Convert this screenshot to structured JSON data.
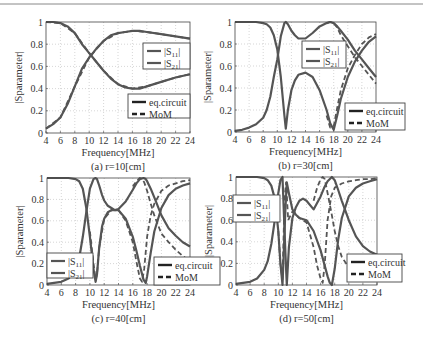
{
  "figure": {
    "top_rule": true,
    "colors": {
      "curve": "#555555",
      "axis": "#444444",
      "grid": "#bbbbbb",
      "text": "#333333"
    }
  },
  "chart_data": [
    {
      "type": "line",
      "caption": "(a) r=10[cm]",
      "xlabel": "Frequency[MHz]",
      "ylabel": "|Sparameter|",
      "xlim": [
        4,
        24
      ],
      "ylim": [
        0,
        1
      ],
      "xticks": [
        4,
        6,
        8,
        10,
        12,
        14,
        16,
        18,
        20,
        22,
        24
      ],
      "yticks": [
        0,
        0.2,
        0.4,
        0.6,
        0.8,
        1
      ],
      "grid": true,
      "legend_s": [
        "|S11|",
        "|S21|"
      ],
      "legend_method": [
        "eq.circuit",
        "MoM"
      ],
      "series": [
        {
          "name": "|S11| eq.circuit",
          "style": "solid",
          "x": [
            4,
            5,
            6,
            7,
            8,
            9,
            10,
            10.5,
            11,
            12,
            13,
            14,
            15,
            16,
            16.5,
            17,
            18,
            20,
            22,
            24
          ],
          "y": [
            1.0,
            1.0,
            0.99,
            0.96,
            0.9,
            0.8,
            0.72,
            0.68,
            0.64,
            0.56,
            0.49,
            0.44,
            0.41,
            0.4,
            0.4,
            0.4,
            0.42,
            0.46,
            0.5,
            0.53
          ]
        },
        {
          "name": "|S21| eq.circuit",
          "style": "solid",
          "x": [
            4,
            5,
            6,
            7,
            8,
            9,
            10,
            10.5,
            11,
            12,
            13,
            14,
            15,
            16,
            17,
            18,
            20,
            22,
            24
          ],
          "y": [
            0.04,
            0.08,
            0.14,
            0.26,
            0.42,
            0.58,
            0.68,
            0.72,
            0.76,
            0.83,
            0.88,
            0.9,
            0.91,
            0.92,
            0.92,
            0.91,
            0.89,
            0.87,
            0.85
          ]
        },
        {
          "name": "|S11| MoM",
          "style": "dashed",
          "x": [
            4,
            6,
            8,
            10,
            12,
            14,
            16,
            18,
            20,
            22,
            24
          ],
          "y": [
            1.0,
            0.99,
            0.9,
            0.72,
            0.56,
            0.44,
            0.4,
            0.42,
            0.46,
            0.5,
            0.53
          ]
        },
        {
          "name": "|S21| MoM",
          "style": "dashed",
          "x": [
            4,
            6,
            8,
            10,
            12,
            14,
            16,
            18,
            20,
            22,
            24
          ],
          "y": [
            0.04,
            0.14,
            0.42,
            0.68,
            0.83,
            0.9,
            0.92,
            0.91,
            0.89,
            0.87,
            0.85
          ]
        }
      ],
      "box": {
        "left": 46,
        "right": 190,
        "top": 22,
        "bottom": 133
      },
      "legend_s_box": {
        "x": 143,
        "y": 43,
        "w": 47,
        "h": 26
      },
      "legend_m_box": {
        "x": 128,
        "y": 94,
        "w": 62,
        "h": 24
      }
    },
    {
      "type": "line",
      "caption": "(b) r=30[cm]",
      "xlabel": "Frequency[MHz]",
      "ylabel": "|Sparameter|",
      "xlim": [
        4,
        24
      ],
      "ylim": [
        0,
        1
      ],
      "xticks": [
        4,
        6,
        8,
        10,
        12,
        14,
        16,
        18,
        20,
        22,
        24
      ],
      "yticks": [
        0,
        0.2,
        0.4,
        0.6,
        0.8,
        1
      ],
      "grid": true,
      "legend_s": [
        "|S11|",
        "|S21|"
      ],
      "legend_method": [
        "eq.circuit",
        "MoM"
      ],
      "series": [
        {
          "name": "|S11| eq.circuit",
          "style": "solid",
          "x": [
            4,
            6,
            7,
            8,
            8.5,
            9,
            9.5,
            10,
            10.5,
            11,
            11.2,
            11.5,
            12,
            12.5,
            13,
            14,
            15,
            16,
            17,
            17.5,
            18,
            18.5,
            19,
            20,
            21,
            22,
            23,
            24
          ],
          "y": [
            1.0,
            1.0,
            1.0,
            0.99,
            0.98,
            0.95,
            0.88,
            0.75,
            0.5,
            0.15,
            0.03,
            0.2,
            0.38,
            0.47,
            0.52,
            0.54,
            0.5,
            0.38,
            0.2,
            0.08,
            0.02,
            0.15,
            0.3,
            0.5,
            0.64,
            0.74,
            0.82,
            0.87
          ]
        },
        {
          "name": "|S21| eq.circuit",
          "style": "solid",
          "x": [
            4,
            5,
            6,
            7,
            8,
            8.5,
            9,
            9.5,
            10,
            10.5,
            11,
            11.2,
            11.5,
            12,
            12.5,
            13,
            14,
            15,
            16,
            17,
            17.5,
            18,
            18.5,
            19,
            20,
            21,
            22,
            23,
            24
          ],
          "y": [
            0.01,
            0.02,
            0.04,
            0.07,
            0.13,
            0.2,
            0.32,
            0.5,
            0.66,
            0.87,
            0.99,
            1.0,
            0.98,
            0.92,
            0.88,
            0.85,
            0.85,
            0.9,
            0.96,
            0.99,
            1.0,
            0.99,
            0.96,
            0.92,
            0.84,
            0.74,
            0.66,
            0.58,
            0.5
          ]
        },
        {
          "name": "|S11| MoM",
          "style": "dashed",
          "x": [
            17,
            17.5,
            18,
            18.5,
            19,
            20,
            21,
            22,
            23,
            24
          ],
          "y": [
            0.15,
            0.04,
            0.05,
            0.22,
            0.38,
            0.58,
            0.7,
            0.8,
            0.86,
            0.89
          ]
        },
        {
          "name": "|S21| MoM",
          "style": "dashed",
          "x": [
            17,
            17.5,
            18,
            18.5,
            19,
            20,
            21,
            22,
            23,
            24
          ],
          "y": [
            0.99,
            1.0,
            0.99,
            0.95,
            0.88,
            0.78,
            0.68,
            0.6,
            0.52,
            0.44
          ]
        }
      ],
      "box": {
        "left": 235,
        "right": 376,
        "top": 22,
        "bottom": 132
      },
      "legend_s_box": {
        "x": 302,
        "y": 41,
        "w": 44,
        "h": 27
      },
      "legend_m_box": {
        "x": 345,
        "y": 103,
        "w": 60,
        "h": 27
      }
    },
    {
      "type": "line",
      "caption": "(c) r=40[cm]",
      "xlabel": "Frequency[MHz]",
      "ylabel": "|Sparameter|",
      "xlim": [
        4,
        24
      ],
      "ylim": [
        0,
        1
      ],
      "xticks": [
        4,
        6,
        8,
        10,
        12,
        14,
        16,
        18,
        20,
        22,
        24
      ],
      "yticks": [
        0,
        0.2,
        0.4,
        0.6,
        0.8,
        1
      ],
      "grid": true,
      "legend_s": [
        "|S11|",
        "|S21|"
      ],
      "legend_method": [
        "eq.circuit",
        "MoM"
      ],
      "series": [
        {
          "name": "|S11| eq.circuit",
          "style": "solid",
          "x": [
            4,
            6,
            7,
            8,
            8.5,
            9,
            9.5,
            10,
            10.5,
            10.8,
            11,
            11.3,
            11.7,
            12,
            12.5,
            13,
            13.5,
            14,
            15,
            16,
            16.5,
            17,
            17.5,
            17.8,
            18,
            18.5,
            19,
            20,
            21,
            22,
            23,
            24
          ],
          "y": [
            1.0,
            1.0,
            1.0,
            0.99,
            0.97,
            0.9,
            0.72,
            0.45,
            0.15,
            0.03,
            0.1,
            0.35,
            0.55,
            0.62,
            0.68,
            0.7,
            0.7,
            0.7,
            0.62,
            0.45,
            0.32,
            0.18,
            0.05,
            0.02,
            0.08,
            0.3,
            0.5,
            0.72,
            0.84,
            0.9,
            0.93,
            0.95
          ]
        },
        {
          "name": "|S21| eq.circuit",
          "style": "solid",
          "x": [
            4,
            5,
            6,
            7,
            8,
            8.5,
            9,
            9.5,
            10,
            10.5,
            10.8,
            11,
            11.3,
            11.7,
            12,
            12.5,
            13,
            13.5,
            14,
            15,
            16,
            16.5,
            17,
            17.5,
            17.8,
            18,
            18.5,
            19,
            20,
            21,
            22,
            23,
            24
          ],
          "y": [
            0.01,
            0.02,
            0.03,
            0.06,
            0.13,
            0.25,
            0.45,
            0.68,
            0.9,
            0.99,
            1.0,
            0.99,
            0.93,
            0.84,
            0.79,
            0.74,
            0.72,
            0.7,
            0.71,
            0.78,
            0.89,
            0.95,
            0.99,
            1.0,
            0.99,
            0.97,
            0.9,
            0.82,
            0.65,
            0.53,
            0.46,
            0.4,
            0.36
          ]
        },
        {
          "name": "|S11| MoM",
          "style": "dashed",
          "x": [
            10,
            10.5,
            10.8,
            11,
            11.3,
            12,
            13,
            14,
            15,
            16,
            16.5,
            17,
            17.3,
            17.6,
            18,
            18.5,
            19,
            20,
            21,
            22,
            23,
            24
          ],
          "y": [
            0.5,
            0.2,
            0.05,
            0.1,
            0.35,
            0.62,
            0.7,
            0.7,
            0.6,
            0.4,
            0.22,
            0.06,
            0.03,
            0.15,
            0.45,
            0.65,
            0.76,
            0.88,
            0.93,
            0.95,
            0.97,
            0.98
          ]
        },
        {
          "name": "|S21| MoM",
          "style": "dashed",
          "x": [
            16,
            16.5,
            17,
            17.3,
            17.6,
            18,
            18.5,
            19,
            20,
            21,
            22,
            23,
            24
          ],
          "y": [
            0.92,
            0.97,
            1.0,
            0.99,
            0.96,
            0.88,
            0.76,
            0.65,
            0.48,
            0.4,
            0.33,
            0.27,
            0.22
          ]
        }
      ],
      "box": {
        "left": 47,
        "right": 190,
        "top": 178,
        "bottom": 285
      },
      "legend_s_box": {
        "x": 47,
        "y": 253,
        "w": 46,
        "h": 25
      },
      "legend_m_box": {
        "x": 154,
        "y": 257,
        "w": 66,
        "h": 28
      }
    },
    {
      "type": "line",
      "caption": "(d) r=50[cm]",
      "xlabel": "Frequency[MHz]",
      "ylabel": "|Sparameter|",
      "xlim": [
        4,
        24
      ],
      "ylim": [
        0,
        1
      ],
      "xticks": [
        4,
        6,
        8,
        10,
        12,
        14,
        16,
        18,
        20,
        22,
        24
      ],
      "yticks": [
        0,
        0.2,
        0.4,
        0.6,
        0.8,
        1
      ],
      "grid": true,
      "legend_s": [
        "|S11|",
        "|S21|"
      ],
      "legend_method": [
        "eq.circuit",
        "MoM"
      ],
      "series": [
        {
          "name": "|S11| eq.circuit",
          "style": "solid",
          "x": [
            4,
            6,
            7,
            8,
            8.5,
            9,
            9.5,
            10,
            10.3,
            10.6,
            11,
            11.2,
            11.5,
            12,
            12.5,
            13,
            14,
            15,
            16,
            16.5,
            17,
            17.3,
            17.6,
            18,
            18.5,
            19,
            20,
            21,
            22,
            23,
            24
          ],
          "y": [
            1.0,
            1.0,
            1.0,
            0.99,
            0.97,
            0.92,
            0.8,
            0.5,
            0.2,
            0.0,
            0.7,
            0.95,
            0.85,
            0.7,
            0.65,
            0.62,
            0.6,
            0.5,
            0.32,
            0.2,
            0.08,
            0.02,
            0.0,
            0.15,
            0.42,
            0.62,
            0.82,
            0.9,
            0.94,
            0.96,
            0.98
          ]
        },
        {
          "name": "|S21| eq.circuit",
          "style": "solid",
          "x": [
            4,
            5,
            6,
            7,
            8,
            8.5,
            9,
            9.5,
            10,
            10.3,
            10.6,
            11,
            11.2,
            11.5,
            12,
            12.5,
            13,
            13.5,
            14,
            15,
            16,
            16.5,
            17,
            17.6,
            18,
            18.5,
            19,
            20,
            21,
            22,
            23,
            24
          ],
          "y": [
            0.01,
            0.02,
            0.03,
            0.06,
            0.14,
            0.22,
            0.38,
            0.6,
            0.85,
            0.97,
            1.0,
            0.3,
            0.0,
            0.35,
            0.62,
            0.72,
            0.78,
            0.8,
            0.78,
            0.7,
            0.82,
            0.9,
            0.96,
            1.0,
            0.97,
            0.88,
            0.78,
            0.6,
            0.45,
            0.36,
            0.31,
            0.28
          ]
        },
        {
          "name": "|S11| MoM",
          "style": "dashed",
          "x": [
            10,
            10.3,
            10.6,
            10.9,
            11.1,
            11.4,
            12,
            13,
            14,
            15,
            15.5,
            16,
            16.3,
            16.6,
            17,
            17.5,
            18,
            19,
            20,
            21,
            22,
            23,
            24
          ],
          "y": [
            0.5,
            0.2,
            0.05,
            0.8,
            0.95,
            0.6,
            0.68,
            0.62,
            0.58,
            0.35,
            0.18,
            0.06,
            0.02,
            0.2,
            0.6,
            0.82,
            0.9,
            0.94,
            0.96,
            0.97,
            0.98,
            0.98,
            0.99
          ]
        },
        {
          "name": "|S21| MoM",
          "style": "dashed",
          "x": [
            15,
            15.5,
            16,
            16.3,
            16.6,
            17,
            17.5,
            18,
            18.5,
            19,
            20,
            21,
            22
          ],
          "y": [
            0.78,
            0.9,
            0.98,
            1.0,
            0.98,
            0.85,
            0.68,
            0.5,
            0.36,
            0.26,
            0.16,
            0.1,
            0.07
          ]
        }
      ],
      "box": {
        "left": 236,
        "right": 377,
        "top": 177,
        "bottom": 285
      },
      "legend_s_box": {
        "x": 233,
        "y": 195,
        "w": 47,
        "h": 27
      },
      "legend_m_box": {
        "x": 347,
        "y": 254,
        "w": 55,
        "h": 28
      }
    }
  ]
}
